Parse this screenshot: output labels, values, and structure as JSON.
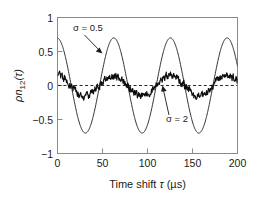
{
  "chart_data": {
    "type": "line",
    "title": "",
    "xlabel": "Time shift τ (μs)",
    "ylabel": "ρn₁₂(τ)",
    "xlim": [
      0,
      200
    ],
    "ylim": [
      -1,
      1
    ],
    "xticks": [
      0,
      50,
      100,
      150,
      200
    ],
    "xtick_labels": [
      "0",
      "50",
      "100",
      "150",
      "200"
    ],
    "yticks": [
      -1,
      -0.5,
      0,
      0.5,
      1
    ],
    "ytick_labels": [
      "−1",
      "−0.5",
      "0",
      "0.5",
      "1"
    ],
    "grid": false,
    "legend": "none",
    "reference_lines": [
      {
        "name": "zero-line",
        "orientation": "horizontal",
        "value": 0,
        "style": "dashed"
      }
    ],
    "series": [
      {
        "name": "sigma-0.5",
        "label": "σ = 0.5",
        "style": "solid-thin",
        "description": "smooth damped-free cosine, amplitude ~0.70, period ~63 µs",
        "amplitude": 0.7,
        "period": 63,
        "phase_offset_us": -0.5,
        "x": [
          0,
          5,
          10,
          15,
          20,
          25,
          30,
          35,
          40,
          45,
          50,
          55,
          60,
          65,
          70,
          75,
          80,
          85,
          90,
          95,
          100,
          105,
          110,
          115,
          120,
          125,
          130,
          135,
          140,
          145,
          150,
          155,
          160,
          165,
          170,
          175,
          180,
          185,
          190,
          195,
          200
        ],
        "y": [
          0.68,
          0.5,
          0.25,
          -0.04,
          -0.33,
          -0.56,
          -0.69,
          -0.69,
          -0.57,
          -0.35,
          -0.07,
          0.22,
          0.48,
          0.65,
          0.7,
          0.63,
          0.45,
          0.19,
          -0.11,
          -0.39,
          -0.6,
          -0.7,
          -0.67,
          -0.51,
          -0.26,
          0.04,
          0.33,
          0.56,
          0.69,
          0.69,
          0.56,
          0.34,
          0.05,
          -0.25,
          -0.5,
          -0.66,
          -0.7,
          -0.61,
          -0.41,
          -0.14,
          0.25
        ]
      },
      {
        "name": "sigma-2",
        "label": "σ = 2",
        "style": "solid-noisy",
        "description": "noisy trace oscillating about zero, envelope amplitude ~0.16",
        "amplitude": 0.15,
        "period": 63,
        "noise_sigma": 0.035,
        "x": [
          0,
          5,
          10,
          15,
          20,
          25,
          30,
          35,
          40,
          45,
          50,
          55,
          60,
          65,
          70,
          75,
          80,
          85,
          90,
          95,
          100,
          105,
          110,
          115,
          120,
          125,
          130,
          135,
          140,
          145,
          150,
          155,
          160,
          165,
          170,
          175,
          180,
          185,
          190,
          195,
          200
        ],
        "y": [
          0.16,
          0.12,
          0.05,
          -0.02,
          -0.08,
          -0.12,
          -0.14,
          -0.14,
          -0.12,
          -0.07,
          -0.01,
          0.05,
          0.11,
          0.14,
          0.16,
          0.14,
          0.1,
          0.04,
          -0.03,
          -0.09,
          -0.13,
          -0.15,
          -0.14,
          -0.11,
          -0.05,
          0.01,
          0.07,
          0.12,
          0.15,
          0.15,
          0.12,
          0.07,
          0.01,
          -0.05,
          -0.11,
          -0.14,
          -0.15,
          -0.13,
          -0.09,
          -0.03,
          0.06
        ]
      }
    ],
    "annotations": [
      {
        "name": "annotation-sigma-05",
        "text": "σ = 0.5",
        "text_x": 18,
        "text_y": 0.86,
        "arrow_from": [
          30,
          0.76
        ],
        "arrow_to": [
          49,
          0.5
        ]
      },
      {
        "name": "annotation-sigma-2",
        "text": "σ = 2",
        "text_x": 124,
        "text_y": -0.46,
        "arrow_from": [
          128,
          -0.36
        ],
        "arrow_to": [
          120,
          0.02
        ]
      }
    ],
    "colors": {
      "background": "#ffffff",
      "axis": "#8a8a8a",
      "text": "#1a1a1a",
      "curve": "#1a1a1a",
      "zero_line": "#2a2a2a"
    }
  }
}
